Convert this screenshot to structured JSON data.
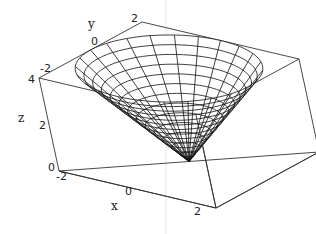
{
  "chart_data": {
    "type": "surface3d",
    "title": "",
    "surface": "cone z = sqrt(x^2 + y^2)",
    "xlabel": "x",
    "ylabel": "y",
    "zlabel": "z",
    "xlim": [
      -2.5,
      2.5
    ],
    "ylim": [
      -2.5,
      2.5
    ],
    "zlim": [
      0,
      4
    ],
    "x_ticks": [
      "-2",
      "0",
      "2"
    ],
    "y_ticks": [
      "-2",
      "0",
      "2"
    ],
    "z_ticks": [
      "0",
      "2",
      "4"
    ],
    "cone": {
      "max_radius": 2.5,
      "radial_lines": 24,
      "rings": 13
    },
    "box": true,
    "grid": false,
    "legend": null,
    "colors": {
      "mesh": "#111111",
      "box": "#333333",
      "background": "#ffffff"
    }
  },
  "labels": {
    "x_axis": "x",
    "y_axis": "y",
    "z_axis": "z",
    "x_tick_neg2": "-2",
    "x_tick_0": "0",
    "x_tick_2": "2",
    "y_tick_neg2": "-2",
    "y_tick_0": "0",
    "y_tick_2": "2",
    "z_tick_0": "0",
    "z_tick_2": "2",
    "z_tick_4": "4"
  }
}
